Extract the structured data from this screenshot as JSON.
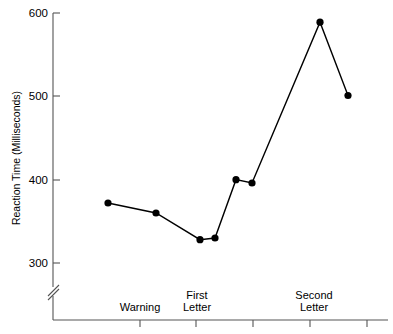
{
  "chart_data": {
    "type": "line",
    "title": "",
    "subtitle": "",
    "xlabel": "",
    "ylabel": "Reaction Time (Milliseconds)",
    "ylim": [
      300,
      600
    ],
    "ytick_labels": [
      "300",
      "400",
      "500",
      "600"
    ],
    "ytick_values": [
      300,
      400,
      500,
      600
    ],
    "grid": false,
    "legend": null,
    "axis_break": true,
    "axis_break_symbol": "//",
    "x": [
      1,
      2,
      3,
      4,
      5,
      6,
      7,
      8
    ],
    "values": [
      372,
      360,
      328,
      330,
      400,
      396,
      589,
      501
    ],
    "x_tick_count": 5,
    "x_category_labels": [
      {
        "line1": "Warning",
        "line2": ""
      },
      {
        "line1": "First",
        "line2": "Letter"
      },
      {
        "line1": "Second",
        "line2": "Letter"
      }
    ],
    "series": [
      {
        "name": "Reaction Time",
        "values": [
          372,
          360,
          328,
          330,
          400,
          396,
          589,
          501
        ]
      }
    ],
    "marker": "filled-circle",
    "line_color": "#000000",
    "marker_color": "#000000",
    "background_color": "#ffffff"
  },
  "axes": {
    "y_label": "Reaction Time (Milliseconds)",
    "y_ticks": [
      "600",
      "500",
      "400",
      "300"
    ],
    "x_labels": {
      "warning": "Warning",
      "first_line1": "First",
      "first_line2": "Letter",
      "second_line1": "Second",
      "second_line2": "Letter"
    }
  }
}
